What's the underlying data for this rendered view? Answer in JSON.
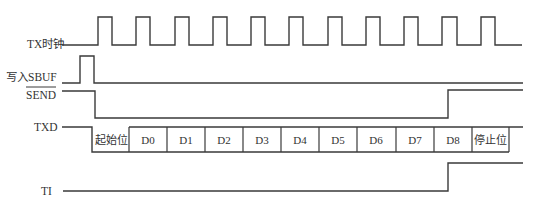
{
  "diagram": {
    "title": "",
    "signals": [
      {
        "id": "tx_clock",
        "label": "TX时钟"
      },
      {
        "id": "write_sbuf",
        "label": "写入SBUF"
      },
      {
        "id": "send",
        "label": "SEND",
        "active_low": true
      },
      {
        "id": "txd",
        "label": "TXD"
      },
      {
        "id": "ti",
        "label": "TI"
      }
    ],
    "txd_frame": [
      "起始位",
      "D0",
      "D1",
      "D2",
      "D3",
      "D4",
      "D5",
      "D6",
      "D7",
      "D8",
      "停止位"
    ],
    "clock_pulse_count": 11,
    "colors": {
      "line": "#3a3a3a",
      "text": "#333333",
      "background": "#ffffff"
    }
  }
}
